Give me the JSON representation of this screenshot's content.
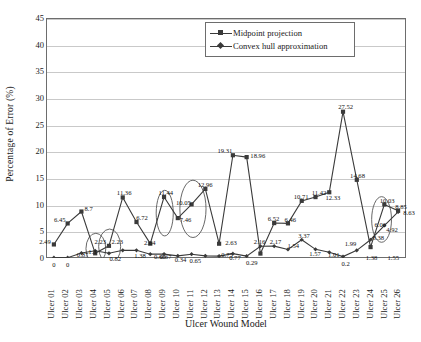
{
  "chart_data": {
    "type": "line",
    "title": "",
    "xlabel": "Ulcer Wound Model",
    "ylabel": "Percentage of Error (%)",
    "ylim": [
      0,
      45
    ],
    "ytick_step": 5,
    "yticks": [
      "0",
      "5",
      "10",
      "15",
      "20",
      "25",
      "30",
      "35",
      "40",
      "45"
    ],
    "grid": true,
    "legend_position": "top-right",
    "categories": [
      "Ulcer 01",
      "Ulcer 02",
      "Ulcer 03",
      "Ulcer 04",
      "Ulcer 05",
      "Ulcer 06",
      "Ulcer 07",
      "Ulcer 08",
      "Ulcer 09",
      "Ulcer 10",
      "Ulcer 11",
      "Ulcer 12",
      "Ulcer 13",
      "Ulcer 14",
      "Ulcer 15",
      "Ulcer 16",
      "Ulcer 17",
      "Ulcer 18",
      "Ulcer 19",
      "Ulcer 20",
      "Ulcer 21",
      "Ulcer 22",
      "Ulcer 23",
      "Ulcer 24",
      "Ulcer 25",
      "Ulcer 26"
    ],
    "series": [
      {
        "name": "Midpoint projection",
        "marker": "square",
        "color": "#3a3a3a",
        "values": [
          2.49,
          6.45,
          8.7,
          0.82,
          2.23,
          11.36,
          6.72,
          2.64,
          11.44,
          7.46,
          10.05,
          12.96,
          2.63,
          19.31,
          18.96,
          0.77,
          6.52,
          6.46,
          10.71,
          11.42,
          12.33,
          27.52,
          14.68,
          1.99,
          10.03,
          8.85
        ]
      },
      {
        "name": "Convex hull approximation",
        "marker": "diamond",
        "color": "#3a3a3a",
        "values": [
          0,
          0,
          0.87,
          1.3,
          0.82,
          1.38,
          1.38,
          0.66,
          0.67,
          0.34,
          0.65,
          0.34,
          0.29,
          0.75,
          0.29,
          2.16,
          2.17,
          1.54,
          3.37,
          1.57,
          1.01,
          0.2,
          1.38,
          3.38,
          6.06,
          8.63
        ]
      }
    ],
    "data_labels": [
      {
        "text": "2.49",
        "x": 0,
        "y": 2.49,
        "dx": -9,
        "dy": -1
      },
      {
        "text": "6.45",
        "x": 1,
        "y": 6.45,
        "dx": -8,
        "dy": -2
      },
      {
        "text": "8.7",
        "x": 2,
        "y": 8.7,
        "dx": 7,
        "dy": -1
      },
      {
        "text": "0",
        "x": 0,
        "y": 0,
        "dx": 0,
        "dy": 9
      },
      {
        "text": "0",
        "x": 1,
        "y": 0,
        "dx": 0,
        "dy": 9
      },
      {
        "text": "0.87",
        "x": 2,
        "y": 0.87,
        "dx": 1,
        "dy": 4
      },
      {
        "text": "1.3",
        "x": 3,
        "y": 1.3,
        "dx": -3,
        "dy": 3
      },
      {
        "text": "2.23",
        "x": 4,
        "y": 2.23,
        "dx": -9,
        "dy": -2
      },
      {
        "text": "2.23",
        "x": 4,
        "y": 2.23,
        "dx": 8,
        "dy": -2
      },
      {
        "text": "0.82",
        "x": 4,
        "y": 0.82,
        "dx": 6,
        "dy": 7
      },
      {
        "text": "11.36",
        "x": 5,
        "y": 11.36,
        "dx": 1,
        "dy": -2
      },
      {
        "text": "6.72",
        "x": 6,
        "y": 6.72,
        "dx": 5,
        "dy": -2
      },
      {
        "text": "1.38",
        "x": 6,
        "y": 1.38,
        "dx": 3,
        "dy": 7
      },
      {
        "text": "2.64",
        "x": 7,
        "y": 2.64,
        "dx": -1,
        "dy": 1
      },
      {
        "text": "0.66",
        "x": 7,
        "y": 0.66,
        "dx": 9,
        "dy": 5
      },
      {
        "text": "11.44",
        "x": 8,
        "y": 11.44,
        "dx": 1,
        "dy": -2
      },
      {
        "text": "0.67",
        "x": 8,
        "y": 0.67,
        "dx": 1,
        "dy": 5
      },
      {
        "text": "7.46",
        "x": 9,
        "y": 7.46,
        "dx": 7,
        "dy": 4
      },
      {
        "text": "0.34",
        "x": 9,
        "y": 0.34,
        "dx": 2,
        "dy": 6
      },
      {
        "text": "10.05",
        "x": 10,
        "y": 10.05,
        "dx": -9,
        "dy": 1
      },
      {
        "text": "0.65",
        "x": 10,
        "y": 0.65,
        "dx": 3,
        "dy": 8
      },
      {
        "text": "12.96",
        "x": 11,
        "y": 12.96,
        "dx": -1,
        "dy": -2
      },
      {
        "text": "0.75",
        "x": 12,
        "y": 0.75,
        "dx": 7,
        "dy": 3
      },
      {
        "text": "2.63",
        "x": 12,
        "y": 2.63,
        "dx": 11,
        "dy": 1
      },
      {
        "text": "0.77",
        "x": 13,
        "y": 0.77,
        "dx": 1,
        "dy": 6
      },
      {
        "text": "19.31",
        "x": 13,
        "y": 19.31,
        "dx": -9,
        "dy": -2
      },
      {
        "text": "18.96",
        "x": 14,
        "y": 18.96,
        "dx": 10,
        "dy": 1
      },
      {
        "text": "0.29",
        "x": 14,
        "y": 0.29,
        "dx": 4,
        "dy": 9
      },
      {
        "text": "2.16",
        "x": 15,
        "y": 2.16,
        "dx": -2,
        "dy": -2
      },
      {
        "text": "2.17",
        "x": 16,
        "y": 2.17,
        "dx": 0,
        "dy": -2
      },
      {
        "text": "6.52",
        "x": 16,
        "y": 6.52,
        "dx": -2,
        "dy": -2
      },
      {
        "text": "1.54",
        "x": 17,
        "y": 1.54,
        "dx": 4,
        "dy": -2
      },
      {
        "text": "6.46",
        "x": 17,
        "y": 6.46,
        "dx": 1,
        "dy": -2
      },
      {
        "text": "10.71",
        "x": 18,
        "y": 10.71,
        "dx": -2,
        "dy": -2
      },
      {
        "text": "3.37",
        "x": 18,
        "y": 3.37,
        "dx": 1,
        "dy": -2
      },
      {
        "text": "11.42",
        "x": 19,
        "y": 11.42,
        "dx": 2,
        "dy": -2
      },
      {
        "text": "1.57",
        "x": 19,
        "y": 1.57,
        "dx": -2,
        "dy": 6
      },
      {
        "text": "12.33",
        "x": 20,
        "y": 12.33,
        "dx": 2,
        "dy": 8
      },
      {
        "text": "1.01",
        "x": 20,
        "y": 1.01,
        "dx": 3,
        "dy": 4
      },
      {
        "text": "27.52",
        "x": 21,
        "y": 27.52,
        "dx": 1,
        "dy": -2
      },
      {
        "text": "0.2",
        "x": 21,
        "y": 0.2,
        "dx": 1,
        "dy": 9
      },
      {
        "text": "14.68",
        "x": 22,
        "y": 14.68,
        "dx": -1,
        "dy": -2
      },
      {
        "text": "1.99",
        "x": 22,
        "y": 1.99,
        "dx": -8,
        "dy": -1
      },
      {
        "text": "1.38",
        "x": 22,
        "y": 1.38,
        "dx": 13,
        "dy": 9
      },
      {
        "text": "3.38",
        "x": 23,
        "y": 3.38,
        "dx": 6,
        "dy": 0
      },
      {
        "text": "10.03",
        "x": 24,
        "y": 10.03,
        "dx": 1,
        "dy": -2
      },
      {
        "text": "6.06",
        "x": 24,
        "y": 6.06,
        "dx": -6,
        "dy": 1
      },
      {
        "text": "1.55",
        "x": 24,
        "y": 1.55,
        "dx": 7,
        "dy": 10
      },
      {
        "text": "4.92",
        "x": 25,
        "y": 4.92,
        "dx": -8,
        "dy": 0
      },
      {
        "text": "8.85",
        "x": 25,
        "y": 8.85,
        "dx": 1,
        "dy": -2
      },
      {
        "text": "8.63",
        "x": 25,
        "y": 8.63,
        "dx": 9,
        "dy": 3
      }
    ],
    "annotations": [
      {
        "shape": "ellipse",
        "cx": 3.55,
        "cy": 1.7,
        "rx": 0.72,
        "ry": 2.9
      },
      {
        "shape": "ellipse",
        "cx": 4.55,
        "cy": 2.1,
        "rx": 0.8,
        "ry": 3.3
      },
      {
        "shape": "ellipse",
        "cx": 8.55,
        "cy": 8.4,
        "rx": 0.62,
        "ry": 4.3
      },
      {
        "shape": "ellipse",
        "cx": 10.6,
        "cy": 9.2,
        "rx": 0.95,
        "ry": 5.4
      },
      {
        "shape": "ellipse",
        "cx": 24.3,
        "cy": 7.2,
        "rx": 0.72,
        "ry": 4.3
      }
    ]
  },
  "legend": {
    "entries": [
      {
        "label": "Midpoint projection"
      },
      {
        "label": "Convex hull approximation"
      }
    ]
  }
}
